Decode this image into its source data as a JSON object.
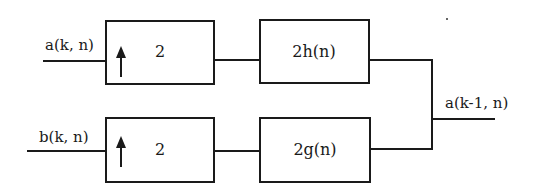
{
  "diagram": {
    "type": "synthesis filter bank block diagram",
    "inputs": {
      "top": "a(k, n)",
      "bottom": "b(k, n)"
    },
    "output": "a(k-1, n)",
    "upsamplers": {
      "top": {
        "factor": "2",
        "icon": "up-arrow-icon"
      },
      "bottom": {
        "factor": "2",
        "icon": "up-arrow-icon"
      }
    },
    "filters": {
      "top": "2h(n)",
      "bottom": "2g(n)"
    },
    "colors": {
      "stroke": "#1a1a1a",
      "background": "#ffffff"
    }
  }
}
